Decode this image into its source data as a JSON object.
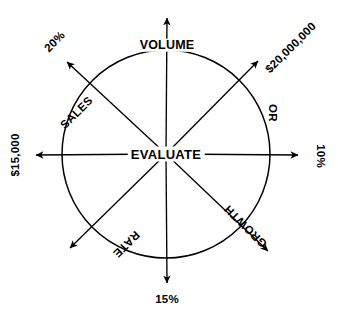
{
  "diagram": {
    "title_center": "EVALUATE",
    "shape": "circle-with-eight-radiating-arrows",
    "stroke_color": "#000000",
    "background_color": "#ffffff",
    "center_x": 166,
    "center_y": 154,
    "radius": 104,
    "spokes": [
      {
        "id": "north",
        "angle_deg": 90,
        "direction": "up",
        "inner_label": "VOLUME",
        "outer_label": "",
        "arrow_tip_x": 167,
        "arrow_tip_y": 13
      },
      {
        "id": "northeast",
        "angle_deg": 45,
        "direction": "up-right",
        "inner_label": "",
        "outer_label": "$20,000,000",
        "arrow_tip_x": 262,
        "arrow_tip_y": 57
      },
      {
        "id": "east",
        "angle_deg": 0,
        "direction": "right",
        "inner_label": "OR",
        "outer_label": "10%",
        "arrow_tip_x": 303,
        "arrow_tip_y": 155
      },
      {
        "id": "southeast",
        "angle_deg": 315,
        "direction": "down-right",
        "inner_label": "GROWTH",
        "outer_label": "",
        "arrow_tip_x": 272,
        "arrow_tip_y": 255
      },
      {
        "id": "south",
        "angle_deg": 270,
        "direction": "down",
        "inner_label": "",
        "outer_label": "15%",
        "arrow_tip_x": 167,
        "arrow_tip_y": 288
      },
      {
        "id": "southwest",
        "angle_deg": 225,
        "direction": "down-left",
        "inner_label": "RATE",
        "outer_label": "",
        "arrow_tip_x": 66,
        "arrow_tip_y": 252
      },
      {
        "id": "west",
        "angle_deg": 180,
        "direction": "left",
        "inner_label": "",
        "outer_label": "$15,000",
        "arrow_tip_x": 31,
        "arrow_tip_y": 155
      },
      {
        "id": "northwest",
        "angle_deg": 135,
        "direction": "up-left",
        "inner_label": "SALES",
        "outer_label": "20%",
        "arrow_tip_x": 63,
        "arrow_tip_y": 58
      }
    ],
    "labels": {
      "volume": "VOLUME",
      "sales": "SALES",
      "or": "OR",
      "growth": "GROWTH",
      "rate": "RATE",
      "value_20_million": "$20,000,000",
      "value_10_percent": "10%",
      "value_15_percent": "15%",
      "value_15000": "$15,000",
      "value_20_percent": "20%"
    }
  }
}
